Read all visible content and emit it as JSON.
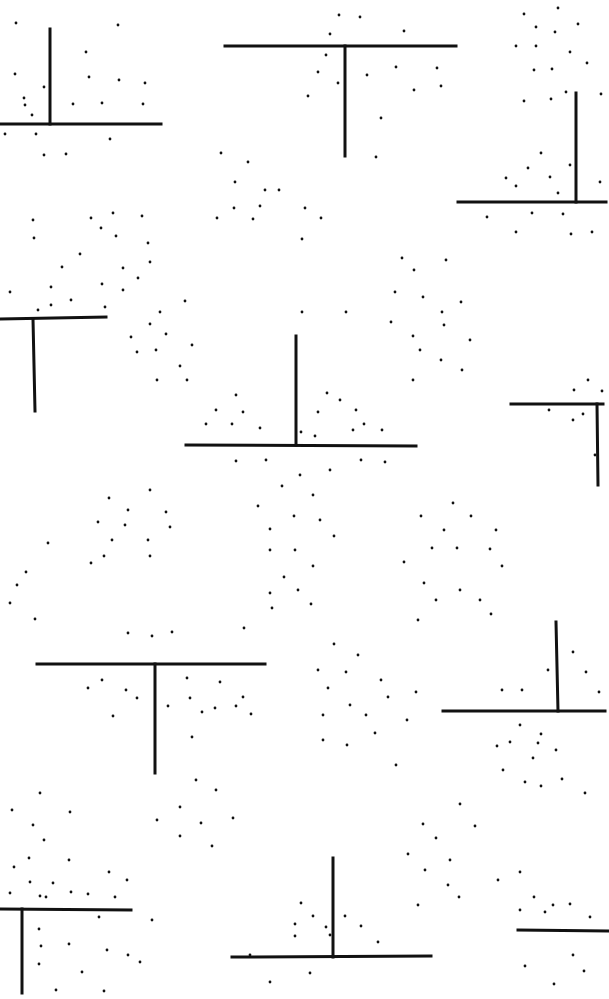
{
  "colors": {
    "background": "#ffffff",
    "ink": "#111111"
  },
  "shapes": [
    {
      "type": "inverted-t",
      "bar": [
        0,
        124,
        161,
        124
      ],
      "stem": [
        50,
        29,
        50,
        124
      ]
    },
    {
      "type": "t",
      "bar": [
        225,
        46,
        456,
        46
      ],
      "stem": [
        345,
        46,
        345,
        156
      ]
    },
    {
      "type": "inverted-t",
      "bar": [
        458,
        202,
        606,
        202
      ],
      "stem": [
        576,
        93,
        576,
        202
      ]
    },
    {
      "type": "t",
      "bar": [
        0,
        319,
        106,
        317
      ],
      "stem": [
        33,
        319,
        35,
        411
      ]
    },
    {
      "type": "inverted-t",
      "bar": [
        186,
        445,
        416,
        446
      ],
      "stem": [
        296,
        336,
        296,
        445
      ]
    },
    {
      "type": "t",
      "bar": [
        511,
        404,
        603,
        404
      ],
      "stem": [
        597,
        404,
        598,
        485
      ]
    },
    {
      "type": "t",
      "bar": [
        37,
        664,
        265,
        664
      ],
      "stem": [
        155,
        664,
        155,
        773
      ]
    },
    {
      "type": "inverted-t",
      "bar": [
        443,
        711,
        605,
        711
      ],
      "stem": [
        556,
        622,
        558,
        711
      ]
    },
    {
      "type": "t",
      "bar": [
        0,
        909,
        131,
        910
      ],
      "stem": [
        22,
        909,
        22,
        993
      ]
    },
    {
      "type": "inverted-t",
      "bar": [
        232,
        957,
        431,
        956
      ],
      "stem": [
        333,
        858,
        333,
        957
      ]
    },
    {
      "type": "t",
      "bar": [
        518,
        930,
        609,
        931
      ],
      "stem": [
        0,
        0,
        0,
        0
      ]
    }
  ],
  "dots": [
    [
      16,
      23
    ],
    [
      118,
      25
    ],
    [
      15,
      74
    ],
    [
      44,
      87
    ],
    [
      24,
      98
    ],
    [
      89,
      77
    ],
    [
      86,
      52
    ],
    [
      25,
      105
    ],
    [
      102,
      103
    ],
    [
      32,
      115
    ],
    [
      145,
      83
    ],
    [
      119,
      80
    ],
    [
      73,
      104
    ],
    [
      143,
      104
    ],
    [
      5,
      134
    ],
    [
      36,
      134
    ],
    [
      44,
      155
    ],
    [
      66,
      154
    ],
    [
      110,
      139
    ],
    [
      339,
      15
    ],
    [
      360,
      17
    ],
    [
      330,
      34
    ],
    [
      404,
      31
    ],
    [
      326,
      55
    ],
    [
      318,
      72
    ],
    [
      396,
      67
    ],
    [
      338,
      83
    ],
    [
      367,
      75
    ],
    [
      414,
      90
    ],
    [
      437,
      68
    ],
    [
      441,
      86
    ],
    [
      381,
      118
    ],
    [
      376,
      157
    ],
    [
      308,
      96
    ],
    [
      524,
      14
    ],
    [
      558,
      8
    ],
    [
      536,
      27
    ],
    [
      555,
      32
    ],
    [
      578,
      24
    ],
    [
      516,
      46
    ],
    [
      536,
      46
    ],
    [
      570,
      52
    ],
    [
      587,
      63
    ],
    [
      534,
      70
    ],
    [
      552,
      69
    ],
    [
      566,
      92
    ],
    [
      524,
      101
    ],
    [
      551,
      99
    ],
    [
      601,
      94
    ],
    [
      541,
      153
    ],
    [
      528,
      168
    ],
    [
      550,
      177
    ],
    [
      506,
      178
    ],
    [
      516,
      186
    ],
    [
      558,
      193
    ],
    [
      570,
      165
    ],
    [
      600,
      182
    ],
    [
      487,
      217
    ],
    [
      532,
      213
    ],
    [
      563,
      214
    ],
    [
      516,
      232
    ],
    [
      571,
      234
    ],
    [
      592,
      232
    ],
    [
      221,
      153
    ],
    [
      248,
      162
    ],
    [
      235,
      182
    ],
    [
      217,
      218
    ],
    [
      265,
      190
    ],
    [
      234,
      208
    ],
    [
      279,
      190
    ],
    [
      260,
      206
    ],
    [
      305,
      208
    ],
    [
      302,
      239
    ],
    [
      321,
      218
    ],
    [
      253,
      219
    ],
    [
      33,
      220
    ],
    [
      34,
      238
    ],
    [
      91,
      218
    ],
    [
      101,
      228
    ],
    [
      113,
      213
    ],
    [
      142,
      216
    ],
    [
      148,
      243
    ],
    [
      116,
      236
    ],
    [
      80,
      254
    ],
    [
      62,
      267
    ],
    [
      123,
      268
    ],
    [
      150,
      262
    ],
    [
      102,
      284
    ],
    [
      123,
      290
    ],
    [
      138,
      278
    ],
    [
      51,
      287
    ],
    [
      10,
      292
    ],
    [
      71,
      300
    ],
    [
      38,
      310
    ],
    [
      51,
      305
    ],
    [
      105,
      307
    ],
    [
      160,
      312
    ],
    [
      185,
      301
    ],
    [
      150,
      324
    ],
    [
      166,
      334
    ],
    [
      192,
      345
    ],
    [
      131,
      337
    ],
    [
      156,
      350
    ],
    [
      180,
      366
    ],
    [
      157,
      380
    ],
    [
      137,
      352
    ],
    [
      187,
      380
    ],
    [
      402,
      258
    ],
    [
      446,
      260
    ],
    [
      414,
      270
    ],
    [
      395,
      292
    ],
    [
      461,
      302
    ],
    [
      423,
      297
    ],
    [
      442,
      312
    ],
    [
      391,
      322
    ],
    [
      413,
      336
    ],
    [
      444,
      325
    ],
    [
      470,
      340
    ],
    [
      420,
      350
    ],
    [
      441,
      360
    ],
    [
      462,
      370
    ],
    [
      413,
      380
    ],
    [
      302,
      312
    ],
    [
      346,
      312
    ],
    [
      236,
      395
    ],
    [
      216,
      410
    ],
    [
      243,
      412
    ],
    [
      206,
      424
    ],
    [
      232,
      424
    ],
    [
      260,
      428
    ],
    [
      327,
      393
    ],
    [
      340,
      400
    ],
    [
      356,
      410
    ],
    [
      318,
      412
    ],
    [
      364,
      424
    ],
    [
      353,
      430
    ],
    [
      301,
      432
    ],
    [
      315,
      436
    ],
    [
      382,
      430
    ],
    [
      236,
      461
    ],
    [
      266,
      460
    ],
    [
      300,
      475
    ],
    [
      330,
      470
    ],
    [
      361,
      460
    ],
    [
      385,
      462
    ],
    [
      588,
      380
    ],
    [
      574,
      390
    ],
    [
      602,
      391
    ],
    [
      549,
      410
    ],
    [
      573,
      420
    ],
    [
      595,
      455
    ],
    [
      583,
      414
    ],
    [
      150,
      490
    ],
    [
      109,
      498
    ],
    [
      128,
      510
    ],
    [
      125,
      525
    ],
    [
      98,
      522
    ],
    [
      166,
      512
    ],
    [
      170,
      527
    ],
    [
      112,
      540
    ],
    [
      148,
      540
    ],
    [
      104,
      556
    ],
    [
      150,
      556
    ],
    [
      91,
      563
    ],
    [
      48,
      543
    ],
    [
      26,
      572
    ],
    [
      17,
      585
    ],
    [
      10,
      603
    ],
    [
      35,
      619
    ],
    [
      282,
      486
    ],
    [
      313,
      495
    ],
    [
      258,
      506
    ],
    [
      294,
      516
    ],
    [
      270,
      529
    ],
    [
      320,
      520
    ],
    [
      334,
      536
    ],
    [
      270,
      550
    ],
    [
      295,
      550
    ],
    [
      313,
      566
    ],
    [
      284,
      577
    ],
    [
      270,
      593
    ],
    [
      298,
      590
    ],
    [
      311,
      604
    ],
    [
      272,
      608
    ],
    [
      244,
      628
    ],
    [
      453,
      503
    ],
    [
      421,
      516
    ],
    [
      471,
      516
    ],
    [
      444,
      530
    ],
    [
      496,
      530
    ],
    [
      432,
      548
    ],
    [
      457,
      548
    ],
    [
      490,
      549
    ],
    [
      502,
      566
    ],
    [
      404,
      562
    ],
    [
      424,
      583
    ],
    [
      460,
      590
    ],
    [
      436,
      600
    ],
    [
      480,
      600
    ],
    [
      491,
      614
    ],
    [
      418,
      620
    ],
    [
      128,
      633
    ],
    [
      152,
      636
    ],
    [
      172,
      632
    ],
    [
      102,
      680
    ],
    [
      88,
      688
    ],
    [
      126,
      690
    ],
    [
      137,
      698
    ],
    [
      187,
      678
    ],
    [
      220,
      682
    ],
    [
      190,
      698
    ],
    [
      243,
      697
    ],
    [
      215,
      708
    ],
    [
      251,
      714
    ],
    [
      113,
      716
    ],
    [
      168,
      706
    ],
    [
      202,
      712
    ],
    [
      236,
      706
    ],
    [
      192,
      737
    ],
    [
      334,
      644
    ],
    [
      358,
      655
    ],
    [
      318,
      670
    ],
    [
      346,
      672
    ],
    [
      381,
      680
    ],
    [
      328,
      688
    ],
    [
      388,
      697
    ],
    [
      416,
      692
    ],
    [
      407,
      720
    ],
    [
      350,
      705
    ],
    [
      366,
      715
    ],
    [
      323,
      715
    ],
    [
      375,
      733
    ],
    [
      323,
      740
    ],
    [
      347,
      745
    ],
    [
      396,
      765
    ],
    [
      573,
      652
    ],
    [
      586,
      672
    ],
    [
      599,
      692
    ],
    [
      502,
      690
    ],
    [
      522,
      690
    ],
    [
      548,
      670
    ],
    [
      510,
      742
    ],
    [
      538,
      743
    ],
    [
      556,
      750
    ],
    [
      503,
      770
    ],
    [
      525,
      782
    ],
    [
      541,
      786
    ],
    [
      562,
      779
    ],
    [
      585,
      793
    ],
    [
      533,
      758
    ],
    [
      497,
      746
    ],
    [
      520,
      725
    ],
    [
      541,
      734
    ],
    [
      196,
      780
    ],
    [
      216,
      790
    ],
    [
      180,
      807
    ],
    [
      157,
      820
    ],
    [
      201,
      823
    ],
    [
      180,
      836
    ],
    [
      233,
      818
    ],
    [
      212,
      846
    ],
    [
      40,
      793
    ],
    [
      12,
      810
    ],
    [
      33,
      825
    ],
    [
      70,
      812
    ],
    [
      44,
      840
    ],
    [
      29,
      858
    ],
    [
      69,
      860
    ],
    [
      14,
      867
    ],
    [
      109,
      872
    ],
    [
      127,
      880
    ],
    [
      30,
      882
    ],
    [
      53,
      883
    ],
    [
      71,
      892
    ],
    [
      10,
      893
    ],
    [
      40,
      896
    ],
    [
      88,
      894
    ],
    [
      115,
      897
    ],
    [
      460,
      804
    ],
    [
      423,
      824
    ],
    [
      475,
      826
    ],
    [
      436,
      838
    ],
    [
      450,
      860
    ],
    [
      408,
      854
    ],
    [
      425,
      870
    ],
    [
      448,
      885
    ],
    [
      498,
      880
    ],
    [
      459,
      897
    ],
    [
      418,
      905
    ],
    [
      520,
      872
    ],
    [
      534,
      897
    ],
    [
      301,
      903
    ],
    [
      313,
      916
    ],
    [
      345,
      916
    ],
    [
      295,
      924
    ],
    [
      326,
      927
    ],
    [
      361,
      926
    ],
    [
      295,
      936
    ],
    [
      330,
      935
    ],
    [
      378,
      942
    ],
    [
      250,
      955
    ],
    [
      270,
      982
    ],
    [
      310,
      973
    ],
    [
      553,
      905
    ],
    [
      520,
      910
    ],
    [
      545,
      912
    ],
    [
      570,
      904
    ],
    [
      590,
      917
    ],
    [
      573,
      955
    ],
    [
      525,
      966
    ],
    [
      584,
      971
    ],
    [
      554,
      984
    ],
    [
      39,
      929
    ],
    [
      41,
      946
    ],
    [
      69,
      944
    ],
    [
      107,
      950
    ],
    [
      128,
      955
    ],
    [
      39,
      964
    ],
    [
      82,
      972
    ],
    [
      56,
      990
    ],
    [
      104,
      991
    ],
    [
      140,
      962
    ],
    [
      152,
      920
    ],
    [
      46,
      897
    ],
    [
      99,
      917
    ]
  ]
}
